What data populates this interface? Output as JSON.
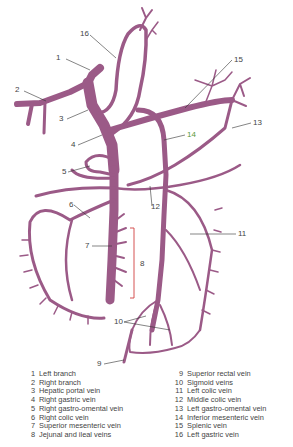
{
  "figure": {
    "vein_color": "#9b5a87",
    "vein_highlight": "#c894b8",
    "leader_color": "#333333",
    "bracket_color": "#d04040"
  },
  "callouts": [
    {
      "num": "1",
      "x": 60,
      "y": 57
    },
    {
      "num": "2",
      "x": 18,
      "y": 89
    },
    {
      "num": "3",
      "x": 61,
      "y": 118
    },
    {
      "num": "4",
      "x": 72,
      "y": 144
    },
    {
      "num": "5",
      "x": 62,
      "y": 171
    },
    {
      "num": "6",
      "x": 69,
      "y": 204
    },
    {
      "num": "7",
      "x": 85,
      "y": 245
    },
    {
      "num": "8",
      "x": 140,
      "y": 263
    },
    {
      "num": "9",
      "x": 98,
      "y": 364
    },
    {
      "num": "10",
      "x": 116,
      "y": 321
    },
    {
      "num": "11",
      "x": 238,
      "y": 233
    },
    {
      "num": "12",
      "x": 153,
      "y": 205
    },
    {
      "num": "13",
      "x": 253,
      "y": 122
    },
    {
      "num": "14",
      "x": 187,
      "y": 134
    },
    {
      "num": "15",
      "x": 234,
      "y": 58
    },
    {
      "num": "16",
      "x": 82,
      "y": 33
    }
  ],
  "legend": {
    "left": [
      {
        "num": "1",
        "label": "Left branch"
      },
      {
        "num": "2",
        "label": "Right branch"
      },
      {
        "num": "3",
        "label": "Hepatic portal vein"
      },
      {
        "num": "4",
        "label": "Right gastric vein"
      },
      {
        "num": "5",
        "label": "Right gastro-omental vein"
      },
      {
        "num": "6",
        "label": "Right colic vein"
      },
      {
        "num": "7",
        "label": "Superior mesenteric vein"
      },
      {
        "num": "8",
        "label": "Jejunal and ileal veins"
      }
    ],
    "right": [
      {
        "num": "9",
        "label": "Superior rectal vein"
      },
      {
        "num": "10",
        "label": "Sigmoid veins"
      },
      {
        "num": "11",
        "label": "Left colic vein"
      },
      {
        "num": "12",
        "label": "Middle colic vein"
      },
      {
        "num": "13",
        "label": "Left gastro-omental vein"
      },
      {
        "num": "14",
        "label": "Inferior mesenteric vein"
      },
      {
        "num": "15",
        "label": "Splenic vein"
      },
      {
        "num": "16",
        "label": "Left gastric vein"
      }
    ]
  }
}
